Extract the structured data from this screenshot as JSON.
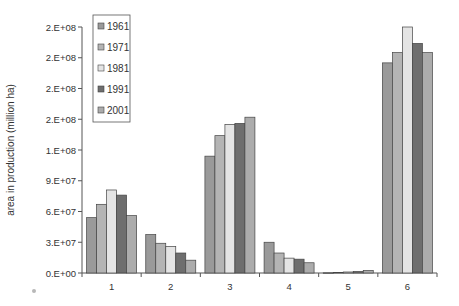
{
  "chart_data": {
    "type": "bar",
    "title": "",
    "xlabel": "",
    "ylabel": "area in production (million ha)",
    "categories": [
      "1",
      "2",
      "3",
      "4",
      "5",
      "6"
    ],
    "series": [
      {
        "name": "1961",
        "color": "#9a9a9a",
        "values": [
          54000000,
          37500000,
          114000000,
          30000000,
          200000,
          205000000
        ]
      },
      {
        "name": "1971",
        "color": "#b4b4b4",
        "values": [
          67000000,
          29000000,
          134000000,
          19500000,
          500000,
          215000000
        ]
      },
      {
        "name": "1981",
        "color": "#e4e4e4",
        "values": [
          81000000,
          26000000,
          145000000,
          14500000,
          1000000,
          240000000
        ]
      },
      {
        "name": "1991",
        "color": "#6e6e6e",
        "values": [
          76000000,
          19500000,
          146000000,
          13500000,
          1500000,
          224000000
        ]
      },
      {
        "name": "2001",
        "color": "#acacac",
        "values": [
          56000000,
          12500000,
          152000000,
          10000000,
          2500000,
          215000000
        ]
      }
    ],
    "y_ticks": [
      0,
      30000000,
      60000000,
      90000000,
      120000000,
      150000000,
      180000000,
      210000000,
      240000000
    ],
    "y_tick_labels": [
      "0.E+00",
      "3.E+07",
      "6.E+07",
      "9.E+07",
      "1.E+08",
      "2.E+08",
      "2.E+08",
      "2.E+08",
      "2.E+08"
    ],
    "ylim": [
      0,
      240000000
    ],
    "grid": false,
    "legend_position": "upper-left-inside"
  }
}
